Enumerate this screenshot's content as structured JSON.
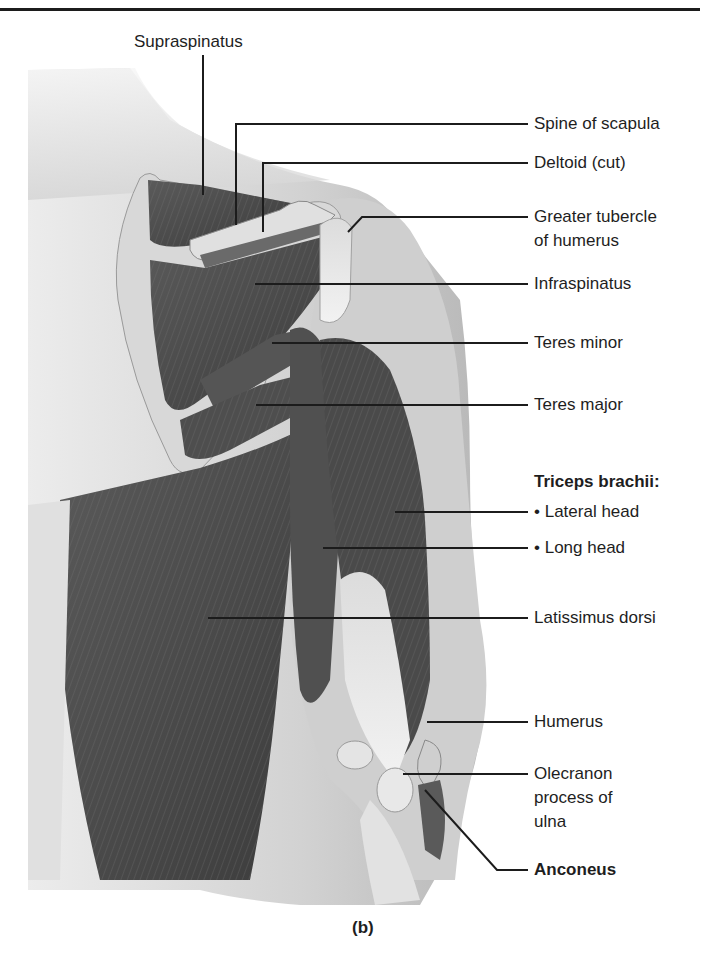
{
  "figure": {
    "panel_label": "(b)"
  },
  "labels": {
    "supraspinatus": "Supraspinatus",
    "spine_of_scapula": "Spine of scapula",
    "deltoid_cut": "Deltoid (cut)",
    "greater_tubercle_line1": "Greater tubercle",
    "greater_tubercle_line2": "of humerus",
    "infraspinatus": "Infraspinatus",
    "teres_minor": "Teres minor",
    "teres_major": "Teres major",
    "triceps_heading": "Triceps brachii:",
    "lateral_head": "• Lateral head",
    "long_head": "• Long head",
    "latissimus_dorsi": "Latissimus dorsi",
    "humerus": "Humerus",
    "olecranon_line1": "Olecranon",
    "olecranon_line2": "process of",
    "olecranon_line3": "ulna",
    "anconeus": "Anconeus"
  },
  "colors": {
    "skin_light": "#e6e6e6",
    "skin_mid": "#c4c4c4",
    "muscle_dark": "#4a4a4a",
    "muscle_mid": "#6a6a6a",
    "tendon": "#e8e8e8",
    "leader_line": "#1c1c1c"
  }
}
